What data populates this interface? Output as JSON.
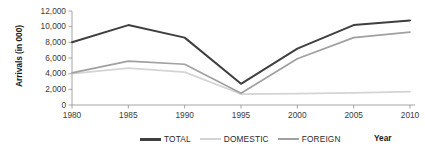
{
  "chart_data": {
    "type": "line",
    "title": "",
    "xlabel": "Year",
    "ylabel": "Arrivals (in 000)",
    "x": [
      1980,
      1985,
      1990,
      1995,
      2000,
      2005,
      2010
    ],
    "categories": [
      "1980",
      "1985",
      "1990",
      "1995",
      "2000",
      "2005",
      "2010"
    ],
    "xticklabels": [
      "1980",
      "1985",
      "1990",
      "1995",
      "2000",
      "2005",
      "2010"
    ],
    "yticklabels": [
      "0",
      "2,000",
      "4,000",
      "6,000",
      "8,000",
      "10,000",
      "12,000"
    ],
    "yticks": [
      0,
      2000,
      4000,
      6000,
      8000,
      10000,
      12000
    ],
    "ylim": [
      0,
      12000
    ],
    "grid": false,
    "legend_position": "bottom",
    "series": [
      {
        "name": "TOTAL",
        "color": "#3f3f3f",
        "values": [
          8000,
          10200,
          8600,
          2700,
          7200,
          10200,
          10800
        ]
      },
      {
        "name": "DOMESTIC",
        "color": "#d4d4d4",
        "values": [
          4000,
          4700,
          4200,
          1400,
          1450,
          1550,
          1700
        ]
      },
      {
        "name": "FOREIGN",
        "color": "#a0a0a0",
        "values": [
          4100,
          5600,
          5200,
          1500,
          5900,
          8600,
          9300
        ]
      }
    ]
  },
  "legend": {
    "items": [
      {
        "label": "TOTAL",
        "color": "#3f3f3f"
      },
      {
        "label": "DOMESTIC",
        "color": "#d4d4d4"
      },
      {
        "label": "FOREIGN",
        "color": "#a0a0a0"
      }
    ]
  },
  "axes": {
    "y_title": "Arrivals (in 000)",
    "x_title": "Year",
    "axis_color": "#9a9a9a"
  }
}
